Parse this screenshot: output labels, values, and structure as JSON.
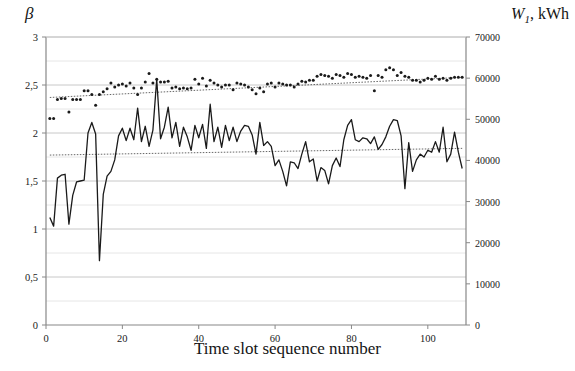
{
  "figure": {
    "left_axis_title": "β",
    "right_axis_title_symbol": "W",
    "right_axis_title_sub": "1",
    "right_axis_title_rest": ", kWh",
    "x_axis_title": "Time slot sequence number"
  },
  "chart_data": {
    "type": "line",
    "title": "",
    "xlabel": "Time slot sequence number",
    "ylabel": "β",
    "y2label": "W1, kWh",
    "xlim": [
      0,
      110
    ],
    "ylim": [
      0,
      3
    ],
    "y2lim": [
      0,
      70000
    ],
    "grid": true,
    "legend": "none",
    "xticks": [
      0,
      20,
      40,
      60,
      80,
      100
    ],
    "xtick_labels": [
      "0",
      "20",
      "40",
      "60",
      "80",
      "100"
    ],
    "yticks": [
      0,
      0.5,
      1,
      1.5,
      2,
      2.5,
      3
    ],
    "ytick_labels": [
      "0",
      "0,5",
      "1",
      "1,5",
      "2",
      "2,5",
      "3"
    ],
    "y2ticks": [
      0,
      10000,
      20000,
      30000,
      40000,
      50000,
      60000,
      70000
    ],
    "y2tick_labels": [
      "0",
      "10000",
      "20000",
      "30000",
      "40000",
      "50000",
      "60000",
      "70000"
    ],
    "series": [
      {
        "name": "W1",
        "type": "line",
        "axis": "right",
        "color": "#1a1a1a",
        "x": [
          1,
          2,
          3,
          4,
          5,
          6,
          7,
          8,
          9,
          10,
          11,
          12,
          13,
          14,
          15,
          16,
          17,
          18,
          19,
          20,
          21,
          22,
          23,
          24,
          25,
          26,
          27,
          28,
          29,
          30,
          31,
          32,
          33,
          34,
          35,
          36,
          37,
          38,
          39,
          40,
          41,
          42,
          43,
          44,
          45,
          46,
          47,
          48,
          49,
          50,
          51,
          52,
          53,
          54,
          55,
          56,
          57,
          58,
          59,
          60,
          61,
          62,
          63,
          64,
          65,
          66,
          67,
          68,
          69,
          70,
          71,
          72,
          73,
          74,
          75,
          76,
          77,
          78,
          79,
          80,
          81,
          82,
          83,
          84,
          85,
          86,
          87,
          88,
          89,
          90,
          91,
          92,
          93,
          94,
          95,
          96,
          97,
          98,
          99,
          100,
          101,
          102,
          103,
          104,
          105,
          106,
          107,
          108,
          109
        ],
        "values_beta": [
          1.12,
          1.03,
          1.53,
          1.56,
          1.57,
          1.05,
          1.35,
          1.49,
          1.5,
          1.51,
          2.0,
          2.11,
          1.99,
          0.67,
          1.36,
          1.55,
          1.6,
          1.72,
          1.97,
          2.05,
          1.92,
          2.05,
          1.93,
          2.26,
          1.91,
          2.07,
          1.86,
          2.03,
          2.56,
          1.94,
          2.06,
          2.27,
          1.95,
          2.11,
          1.86,
          2.06,
          1.96,
          1.82,
          2.08,
          1.95,
          2.09,
          1.84,
          2.3,
          1.91,
          2.06,
          1.85,
          2.08,
          1.92,
          2.06,
          1.91,
          2.02,
          2.08,
          2.07,
          1.98,
          1.78,
          2.11,
          1.87,
          1.91,
          1.86,
          1.66,
          1.72,
          1.6,
          1.45,
          1.7,
          1.69,
          1.63,
          1.78,
          1.91,
          1.7,
          1.73,
          1.5,
          1.64,
          1.61,
          1.47,
          1.66,
          1.74,
          1.65,
          1.93,
          2.08,
          2.14,
          1.93,
          1.91,
          1.95,
          1.94,
          1.89,
          1.96,
          1.83,
          1.88,
          1.96,
          2.07,
          2.14,
          2.13,
          1.97,
          1.42,
          1.9,
          1.6,
          1.72,
          1.78,
          1.75,
          1.82,
          1.8,
          1.91,
          1.8,
          2.06,
          1.7,
          1.78,
          2.01,
          1.8,
          1.63
        ],
        "values_kwh": [
          26100,
          24000,
          35700,
          36400,
          36600,
          24500,
          31500,
          34800,
          35000,
          35200,
          46700,
          49200,
          46400,
          15600,
          31700,
          36100,
          37300,
          40100,
          46000,
          47800,
          44800,
          47800,
          45000,
          52700,
          44600,
          48300,
          43400,
          47400,
          59700,
          45300,
          48100,
          53000,
          45500,
          49200,
          43400,
          48100,
          45700,
          42500,
          48500,
          45500,
          48800,
          42900,
          53700,
          44600,
          48100,
          43200,
          48500,
          44800,
          48100,
          44600,
          47100,
          48500,
          48300,
          46200,
          41500,
          49200,
          43600,
          44600,
          43400,
          38700,
          40100,
          37300,
          33800,
          39700,
          39400,
          38000,
          41500,
          44600,
          39700,
          40400,
          35000,
          38300,
          37600,
          34300,
          38700,
          40600,
          38500,
          45000,
          48500,
          49900,
          45000,
          44600,
          45500,
          45300,
          44100,
          45700,
          42700,
          43900,
          45700,
          48300,
          49900,
          49700,
          46000,
          33100,
          44300,
          37300,
          40100,
          41500,
          40800,
          42500,
          42000,
          44600,
          42000,
          48100,
          39700,
          41500,
          46900,
          42000,
          38000
        ]
      },
      {
        "name": "beta",
        "type": "scatter",
        "axis": "left",
        "color": "#1a1a1a",
        "x": [
          1,
          2,
          3,
          4,
          5,
          6,
          7,
          8,
          9,
          10,
          11,
          12,
          13,
          14,
          15,
          16,
          17,
          18,
          19,
          20,
          21,
          22,
          23,
          24,
          25,
          26,
          27,
          28,
          29,
          30,
          31,
          32,
          33,
          34,
          35,
          36,
          37,
          38,
          39,
          40,
          41,
          42,
          43,
          44,
          45,
          46,
          47,
          48,
          49,
          50,
          51,
          52,
          53,
          54,
          55,
          56,
          57,
          58,
          59,
          60,
          61,
          62,
          63,
          64,
          65,
          66,
          67,
          68,
          69,
          70,
          71,
          72,
          73,
          74,
          75,
          76,
          77,
          78,
          79,
          80,
          81,
          82,
          83,
          84,
          85,
          86,
          87,
          88,
          89,
          90,
          91,
          92,
          93,
          94,
          95,
          96,
          97,
          98,
          99,
          100,
          101,
          102,
          103,
          104,
          105,
          106,
          107,
          108,
          109
        ],
        "values": [
          2.15,
          2.15,
          2.35,
          2.36,
          2.36,
          2.22,
          2.35,
          2.35,
          2.35,
          2.44,
          2.44,
          2.4,
          2.29,
          2.4,
          2.43,
          2.46,
          2.52,
          2.48,
          2.5,
          2.51,
          2.49,
          2.52,
          2.47,
          2.4,
          2.47,
          2.53,
          2.62,
          2.52,
          2.56,
          2.53,
          2.53,
          2.54,
          2.47,
          2.48,
          2.46,
          2.47,
          2.46,
          2.47,
          2.56,
          2.51,
          2.57,
          2.49,
          2.55,
          2.52,
          2.5,
          2.48,
          2.5,
          2.5,
          2.45,
          2.52,
          2.51,
          2.5,
          2.48,
          2.45,
          2.41,
          2.47,
          2.43,
          2.51,
          2.52,
          2.48,
          2.52,
          2.51,
          2.5,
          2.5,
          2.48,
          2.51,
          2.54,
          2.53,
          2.55,
          2.55,
          2.59,
          2.61,
          2.6,
          2.59,
          2.57,
          2.61,
          2.6,
          2.58,
          2.62,
          2.61,
          2.58,
          2.59,
          2.58,
          2.57,
          2.6,
          2.44,
          2.6,
          2.58,
          2.66,
          2.68,
          2.66,
          2.6,
          2.63,
          2.59,
          2.58,
          2.55,
          2.55,
          2.53,
          2.55,
          2.57,
          2.56,
          2.59,
          2.56,
          2.57,
          2.55,
          2.57,
          2.58,
          2.58,
          2.58
        ]
      },
      {
        "name": "beta-trend",
        "type": "trendline",
        "axis": "left",
        "style": "dotted",
        "color": "#555555",
        "x": [
          1,
          109
        ],
        "values": [
          2.37,
          2.58
        ]
      },
      {
        "name": "W1-trend",
        "type": "trendline",
        "axis": "left",
        "style": "dotted",
        "color": "#555555",
        "x": [
          1,
          109
        ],
        "values": [
          1.77,
          1.84
        ]
      }
    ]
  }
}
